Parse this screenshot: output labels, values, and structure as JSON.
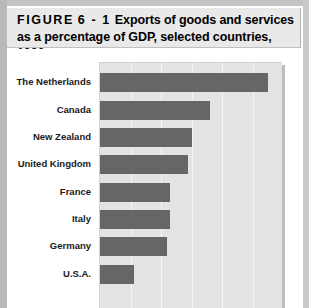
{
  "figure": {
    "number": "FIGURE 6-1",
    "number_prefix": "FIGURE",
    "number_suffix": "6 - 1",
    "caption": "Exports of goods and services as a percentage of GDP, selected countries, 1996",
    "title_line1": "Exports of goods and services as",
    "title_line2": "a percentage of GDP, selected countries, 1996"
  },
  "colors": {
    "bar": "#666666",
    "plot_background": "#e3e3e3",
    "gridline": "#f4f4f4",
    "banner": "#e9e9e9",
    "page": "#ffffff"
  },
  "chart_data": {
    "type": "bar",
    "orientation": "horizontal",
    "title": "Exports of goods and services as a percentage of GDP, selected countries, 1996",
    "xlabel": "",
    "ylabel": "",
    "xlim": [
      0,
      60
    ],
    "xticks": [
      0,
      10,
      20,
      30,
      40,
      50,
      60
    ],
    "grid": true,
    "legend": false,
    "note": "Bottom of figure is cropped; x-axis tick labels and axis title are not visible.",
    "categories": [
      "The Netherlands",
      "Canada",
      "New Zealand",
      "United Kingdom",
      "France",
      "Italy",
      "Germany",
      "U.S.A."
    ],
    "values": [
      55,
      36,
      30,
      29,
      23,
      23,
      22,
      11
    ]
  }
}
